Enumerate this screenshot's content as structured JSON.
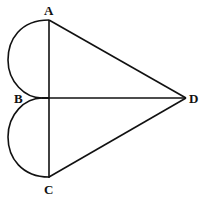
{
  "diagram": {
    "labels": {
      "A": "A",
      "B": "B",
      "C": "C",
      "D": "D"
    },
    "points": {
      "A": [
        49,
        20
      ],
      "B": [
        49,
        98
      ],
      "C": [
        49,
        177
      ],
      "D": [
        186,
        98
      ]
    },
    "segments": [
      [
        "A",
        "C"
      ],
      [
        "B",
        "D"
      ],
      [
        "A",
        "D"
      ],
      [
        "C",
        "D"
      ]
    ],
    "arcs": [
      {
        "name": "upper-semicircle",
        "from": "A",
        "to": "B",
        "side": "left"
      },
      {
        "name": "lower-semicircle",
        "from": "B",
        "to": "C",
        "side": "left"
      }
    ],
    "stroke_color": "#111111"
  }
}
